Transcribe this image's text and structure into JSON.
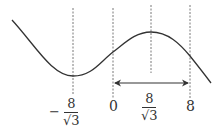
{
  "diagram": {
    "type": "function-graph",
    "colors": {
      "stroke": "#333333",
      "dashed": "#555555",
      "background": "#ffffff"
    },
    "labels": {
      "min_x": {
        "sign": "−",
        "numerator": "8",
        "denominator": "√3"
      },
      "zero": "0",
      "max_x": {
        "numerator": "8",
        "denominator": "√3"
      },
      "eight": "8"
    },
    "vertical_guides": [
      {
        "name": "x-neg-8-over-root3",
        "x": 73
      },
      {
        "name": "x-zero",
        "x": 113
      },
      {
        "name": "x-8-over-root3",
        "x": 151
      },
      {
        "name": "x-eight",
        "x": 190
      }
    ],
    "interval_arrow": {
      "from": "0",
      "to": "8"
    }
  }
}
